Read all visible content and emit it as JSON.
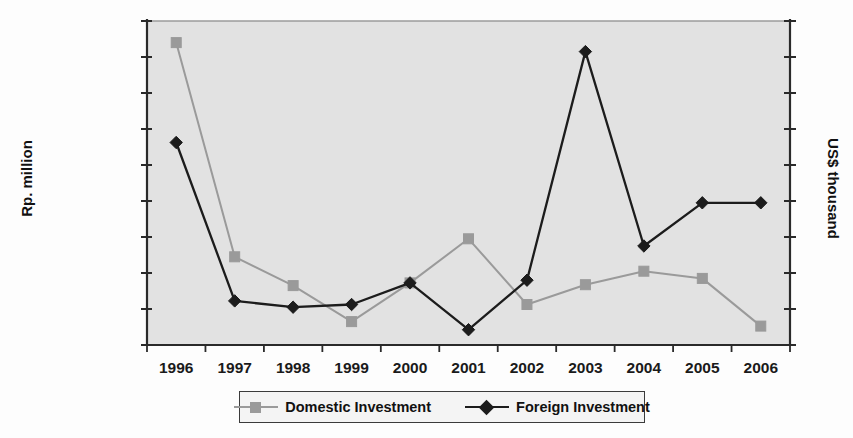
{
  "chart_data": {
    "type": "line",
    "title": "",
    "xlabel": "",
    "ylabel": "Rp. million",
    "y2label": "US$ thousand",
    "categories": [
      "1996",
      "1997",
      "1998",
      "1999",
      "2000",
      "2001",
      "2002",
      "2003",
      "2004",
      "2005",
      "2006"
    ],
    "ytick_labels": [
      "0",
      "2000000",
      "4000000",
      "6000000",
      "8000000",
      "10000000",
      "12000000",
      "14000000",
      "16000000",
      "18000000"
    ],
    "ytick_values": [
      0,
      2000000,
      4000000,
      6000000,
      8000000,
      10000000,
      12000000,
      14000000,
      16000000,
      18000000
    ],
    "ylim": [
      0,
      18000000
    ],
    "y2lim": [
      0,
      18000000
    ],
    "y2tick_labels": [],
    "grid": false,
    "legend_position": "bottom",
    "series": [
      {
        "name": "Domestic Investment",
        "axis": "left",
        "color": "#9a9a9a",
        "marker": "square",
        "values": [
          16800000,
          4900000,
          3300000,
          1300000,
          3450000,
          5900000,
          2250000,
          3350000,
          4100000,
          3700000,
          1050000
        ]
      },
      {
        "name": "Foreign Investment",
        "axis": "right",
        "color": "#1c1c1c",
        "marker": "diamond",
        "values": [
          11250000,
          2450000,
          2100000,
          2250000,
          3450000,
          850000,
          3600000,
          16300000,
          5500000,
          7900000,
          7900000
        ]
      }
    ]
  },
  "legend": {
    "items": [
      {
        "label": "Domestic Investment"
      },
      {
        "label": "Foreign Investment"
      }
    ]
  },
  "colors": {
    "plot_background": "#e2e2e2",
    "page_background": "#fdfdfd",
    "axis": "#2a2a2a",
    "domestic": "#9a9a9a",
    "foreign": "#1c1c1c"
  }
}
